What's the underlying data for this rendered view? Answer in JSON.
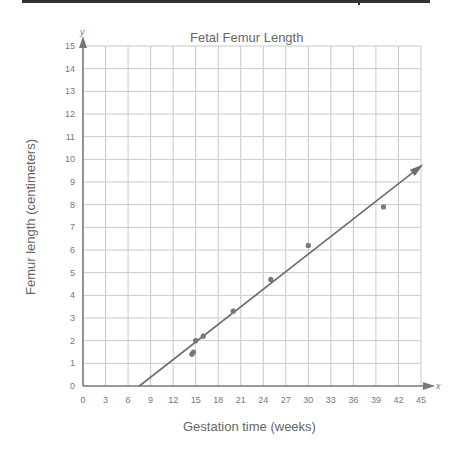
{
  "chart_data": {
    "type": "scatter",
    "title": "Fetal Femur Length",
    "xlabel": "Gestation time (weeks)",
    "ylabel": "Femur length (centimeters)",
    "x_axis_letter": "x",
    "y_axis_letter": "y",
    "xlim": [
      0,
      45
    ],
    "ylim": [
      0,
      15
    ],
    "x_ticks": [
      0,
      3,
      6,
      9,
      12,
      15,
      18,
      21,
      24,
      27,
      30,
      33,
      36,
      39,
      42,
      45
    ],
    "y_ticks": [
      0,
      1,
      2,
      3,
      4,
      5,
      6,
      7,
      8,
      9,
      10,
      11,
      12,
      13,
      14,
      15
    ],
    "grid": true,
    "legend": null,
    "series": [
      {
        "name": "Measurements",
        "points": [
          {
            "x": 14.5,
            "y": 1.4
          },
          {
            "x": 14.7,
            "y": 1.5
          },
          {
            "x": 15,
            "y": 2.0
          },
          {
            "x": 16,
            "y": 2.2
          },
          {
            "x": 20,
            "y": 3.3
          },
          {
            "x": 25,
            "y": 4.7
          },
          {
            "x": 30,
            "y": 6.2
          },
          {
            "x": 40,
            "y": 7.9
          }
        ]
      }
    ],
    "trend_line": {
      "x1": 7.5,
      "y1": 0,
      "x2": 45,
      "y2": 9.7,
      "arrow_end": true
    },
    "colors": {
      "grid": "#c8c8c8",
      "axis": "#777777",
      "line": "#6e6e6e",
      "points": "#777777"
    }
  }
}
